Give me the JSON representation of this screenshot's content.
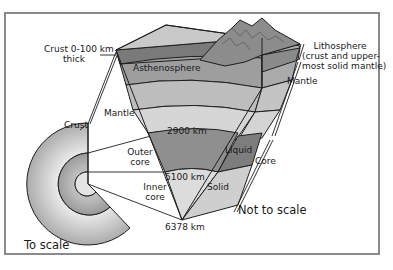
{
  "diagram": {
    "labels": {
      "crust_thickness_line1": "Crust 0-100 km",
      "crust_thickness_line2": "thick",
      "asthenosphere": "Asthenosphere",
      "lithosphere_line1": "Lithosphere",
      "lithosphere_line2": "(crust and upper-",
      "lithosphere_line3": "most solid mantle)",
      "mantle_right": "Mantle",
      "mantle_left": "Mantle",
      "crust": "Crust",
      "depth_2900": "2900 km",
      "depth_5100": "5100 km",
      "depth_6378": "6378 km",
      "outer_core_line1": "Outer",
      "outer_core_line2": "core",
      "inner_core_line1": "Inner",
      "inner_core_line2": "core",
      "liquid": "Liquid",
      "solid": "Solid",
      "core": "Core",
      "to_scale": "To scale",
      "not_to_scale": "Not to scale"
    },
    "colors": {
      "frame": "#8a8a8a",
      "outline": "#1e1e1e",
      "surface_top": "#c9c9c9",
      "mountains": "#8c8c8c",
      "lithosphere": "#7a7a7a",
      "asthenosphere": "#9e9e9e",
      "upper_mantle": "#bdbdbd",
      "lower_mantle": "#d6d6d6",
      "outer_core": "#8f8f8f",
      "inner_core": "#dcdcdc",
      "side_face_light": "#c4c4c4",
      "side_face_dark": "#7d7d7d"
    }
  }
}
